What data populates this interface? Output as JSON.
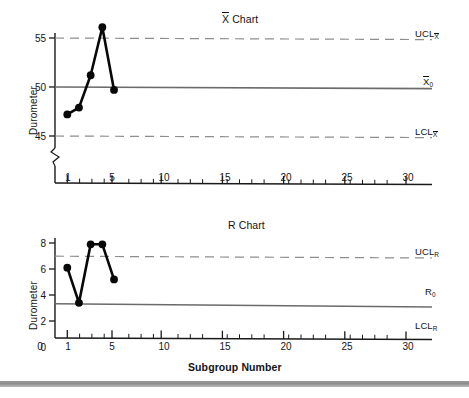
{
  "figure": {
    "bottom_bar_color": "#9a9a9a",
    "background": "#ffffff"
  },
  "charts": [
    {
      "id": "xbar",
      "title_prefix": "X",
      "title_suffix": " Chart",
      "title_full": "X̄ Chart",
      "ylabel": "Durometer",
      "xlabel": "",
      "yticks": [
        "45",
        "50",
        "55"
      ],
      "ytick_values": [
        45,
        50,
        55
      ],
      "xticks": [
        "1",
        "5",
        "10",
        "15",
        "20",
        "25",
        "30"
      ],
      "xtick_values": [
        1,
        5,
        10,
        15,
        20,
        25,
        30
      ],
      "axis_break": true,
      "limits": {
        "ucl_label": "UCL",
        "ucl_sub": "X",
        "center_label": "X",
        "center_sub": "0",
        "lcl_label": "LCL",
        "lcl_sub": "X",
        "ucl_value": 55,
        "center_value": 50,
        "lcl_value": 45
      }
    },
    {
      "id": "rchart",
      "title_prefix": "",
      "title_suffix": "R Chart",
      "title_full": "R Chart",
      "ylabel": "Durometer",
      "xlabel": "Subgroup Number",
      "yticks": [
        "0",
        "2",
        "4",
        "6",
        "8"
      ],
      "ytick_values": [
        0,
        2,
        4,
        6,
        8
      ],
      "xticks": [
        "0",
        "1",
        "5",
        "10",
        "15",
        "20",
        "25",
        "30"
      ],
      "xtick_values": [
        0,
        1,
        5,
        10,
        15,
        20,
        25,
        30
      ],
      "axis_break": false,
      "limits": {
        "ucl_label": "UCL",
        "ucl_sub": "R",
        "center_label": "R",
        "center_sub": "0",
        "lcl_label": "LCL",
        "lcl_sub": "R",
        "ucl_value": 6.6,
        "center_value": 3.4,
        "lcl_value": 0
      }
    }
  ],
  "chart_data": [
    {
      "type": "line",
      "id": "xbar-chart",
      "title": "X̄ Chart",
      "xlabel": "",
      "ylabel": "Durometer",
      "x": [
        1,
        2,
        3,
        4,
        5
      ],
      "values": [
        52.8,
        52.1,
        48.8,
        43.9,
        50.3
      ],
      "series": [
        {
          "name": "Subgroup average",
          "values": [
            52.8,
            52.1,
            48.8,
            43.9,
            50.3
          ]
        }
      ],
      "xlim": [
        0.4,
        31
      ],
      "ylim": [
        42.2,
        56.6
      ],
      "xticks": [
        1,
        5,
        10,
        15,
        20,
        25,
        30
      ],
      "yticks": [
        45,
        50,
        55
      ],
      "grid": false,
      "legend": "none",
      "markers": "filled-circle",
      "annotations": [
        {
          "text": "UCL",
          "sub": "X̄",
          "value": 55,
          "style": "dashed",
          "position": "right"
        },
        {
          "text": "X̄0",
          "sub": "0",
          "value": 50,
          "style": "solid",
          "position": "right"
        },
        {
          "text": "LCL",
          "sub": "X̄",
          "value": 45,
          "style": "dashed",
          "position": "right"
        }
      ],
      "axis_break_y": true
    },
    {
      "type": "line",
      "id": "r-chart",
      "title": "R Chart",
      "xlabel": "Subgroup Number",
      "ylabel": "Durometer",
      "x": [
        1,
        2,
        3,
        4,
        5
      ],
      "values": [
        3.9,
        6.6,
        2.1,
        2.1,
        4.8
      ],
      "series": [
        {
          "name": "Subgroup range",
          "values": [
            3.9,
            6.6,
            2.1,
            2.1,
            4.8
          ]
        }
      ],
      "xlim": [
        0,
        31
      ],
      "ylim": [
        0,
        8.8
      ],
      "xticks": [
        0,
        1,
        5,
        10,
        15,
        20,
        25,
        30
      ],
      "yticks": [
        0,
        2,
        4,
        6,
        8
      ],
      "grid": false,
      "legend": "none",
      "markers": "filled-circle",
      "annotations": [
        {
          "text": "UCL",
          "sub": "R",
          "value": 6.6,
          "style": "dashed",
          "position": "right"
        },
        {
          "text": "R",
          "sub": "0",
          "value": 3.4,
          "style": "solid",
          "position": "right"
        },
        {
          "text": "LCL",
          "sub": "R",
          "value": 0,
          "style": "solid",
          "position": "right"
        }
      ],
      "axis_break_y": false
    }
  ]
}
